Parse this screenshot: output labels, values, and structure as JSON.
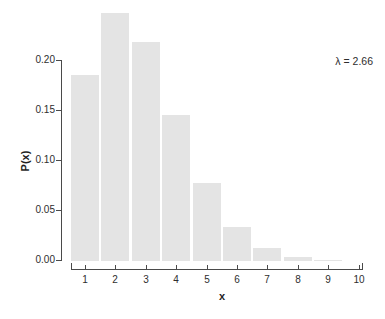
{
  "chart_data": {
    "type": "bar",
    "title": "",
    "xlabel": "x",
    "ylabel": "P(x)",
    "annotation": "λ = 2.66",
    "lambda_value": 2.66,
    "categories": [
      "1",
      "2",
      "3",
      "4",
      "5",
      "6",
      "7",
      "8",
      "9",
      "10"
    ],
    "values": [
      0.1861,
      0.2475,
      0.2194,
      0.1459,
      0.0776,
      0.0344,
      0.0131,
      0.0044,
      0.0013,
      0.0003
    ],
    "ylim": [
      0,
      0.2
    ],
    "y_ticks": [
      {
        "label": "0.00",
        "value": 0.0
      },
      {
        "label": "0.05",
        "value": 0.05
      },
      {
        "label": "0.10",
        "value": 0.1
      },
      {
        "label": "0.15",
        "value": 0.15
      },
      {
        "label": "0.20",
        "value": 0.2
      }
    ],
    "grid": false,
    "legend": "none",
    "colors": {
      "bar": "#e4e4e4",
      "axis": "#4a4a4a",
      "text": "#2e2e2e",
      "background": "#ffffff"
    }
  }
}
